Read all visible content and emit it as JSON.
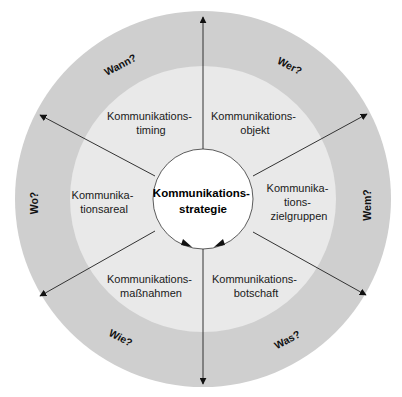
{
  "diagram": {
    "center": {
      "line1": "Kommunikations-",
      "line2": "strategie"
    },
    "segments": [
      {
        "id": "timing",
        "line1": "Kommunikations-",
        "line2": "timing",
        "question": "Wann?"
      },
      {
        "id": "objekt",
        "line1": "Kommunikations-",
        "line2": "objekt",
        "question": "Wer?"
      },
      {
        "id": "zielgruppen",
        "line1": "Kommunika-",
        "line2": "tions-",
        "line3": "zielgruppen",
        "question": "Wem?"
      },
      {
        "id": "botschaft",
        "line1": "Kommunikations-",
        "line2": "botschaft",
        "question": "Was?"
      },
      {
        "id": "massnahmen",
        "line1": "Kommunikations-",
        "line2": "maßnahmen",
        "question": "Wie?"
      },
      {
        "id": "areal",
        "line1": "Kommunika-",
        "line2": "tionsareal",
        "question": "Wo?"
      }
    ],
    "colors": {
      "outer_ring": "#cfcfcf",
      "inner_disc": "#e9e9e9",
      "center_disc": "#ffffff",
      "stroke": "#333333"
    }
  }
}
